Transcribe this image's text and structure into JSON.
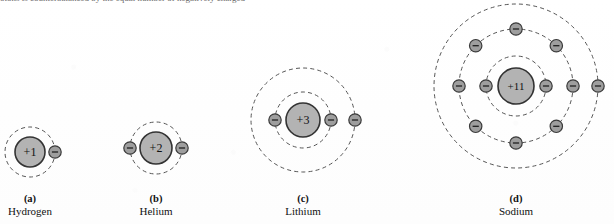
{
  "figure": {
    "cropped_body_text": "otons is counterbalanced by the equal number of negatively charged",
    "background_color": "#fefefe",
    "nucleus_fill": "#b3b3b3",
    "nucleus_stroke": "#333333",
    "electron_fill": "#9e9e9e",
    "electron_stroke": "#3a3a3a",
    "orbit_stroke": "#555555",
    "text_color": "#111111"
  },
  "atoms": [
    {
      "id": "hydrogen",
      "letter": "(a)",
      "name": "Hydrogen",
      "nucleus_charge": "+1",
      "center_x": 30,
      "center_y": 152,
      "nucleus_radius": 15,
      "shells": [
        {
          "radius": 25,
          "electron_angles": [
            0
          ]
        }
      ],
      "caption_x": 30,
      "caption_y": 193
    },
    {
      "id": "helium",
      "letter": "(b)",
      "name": "Helium",
      "nucleus_charge": "+2",
      "center_x": 156,
      "center_y": 148,
      "nucleus_radius": 16,
      "shells": [
        {
          "radius": 26,
          "electron_angles": [
            0,
            180
          ]
        }
      ],
      "caption_x": 156,
      "caption_y": 193
    },
    {
      "id": "lithium",
      "letter": "(c)",
      "name": "Lithium",
      "nucleus_charge": "+3",
      "center_x": 303,
      "center_y": 120,
      "nucleus_radius": 17,
      "shells": [
        {
          "radius": 28,
          "electron_angles": [
            0,
            180
          ]
        },
        {
          "radius": 52,
          "electron_angles": [
            0
          ]
        }
      ],
      "caption_x": 303,
      "caption_y": 193
    },
    {
      "id": "sodium",
      "letter": "(d)",
      "name": "Sodium",
      "nucleus_charge": "+11",
      "center_x": 516,
      "center_y": 86,
      "nucleus_radius": 18,
      "shells": [
        {
          "radius": 30,
          "electron_angles": [
            0,
            180
          ]
        },
        {
          "radius": 57,
          "electron_angles": [
            0,
            45,
            90,
            135,
            180,
            225,
            270,
            315
          ]
        },
        {
          "radius": 82,
          "electron_angles": [
            0
          ]
        }
      ],
      "caption_x": 516,
      "caption_y": 193
    }
  ]
}
